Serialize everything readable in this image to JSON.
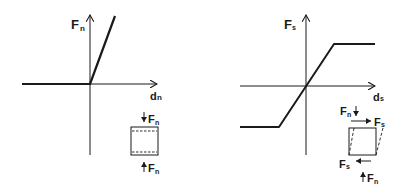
{
  "diagram": {
    "panels": [
      {
        "id": "normal",
        "y_axis_label": {
          "main": "F",
          "sub": "n"
        },
        "x_axis_label": {
          "main": "d",
          "sub": "n"
        },
        "curve_description": "zero force for negative displacement, linear increase for positive displacement",
        "element_labels": {
          "top_force": {
            "main": "F",
            "sub": "n"
          },
          "bottom_force": {
            "main": "F",
            "sub": "n"
          }
        }
      },
      {
        "id": "shear",
        "y_axis_label": {
          "main": "F",
          "sub": "s"
        },
        "x_axis_label": {
          "main": "d",
          "sub": "s"
        },
        "curve_description": "linear through origin, saturating at constant positive and negative limits",
        "element_labels": {
          "top_normal": {
            "main": "F",
            "sub": "n"
          },
          "top_shear": {
            "main": "F",
            "sub": "s"
          },
          "bottom_shear": {
            "main": "F",
            "sub": "s"
          },
          "bottom_normal": {
            "main": "F",
            "sub": "n"
          }
        }
      }
    ],
    "colors": {
      "ink": "#1a1a1a",
      "background": "#ffffff"
    }
  }
}
